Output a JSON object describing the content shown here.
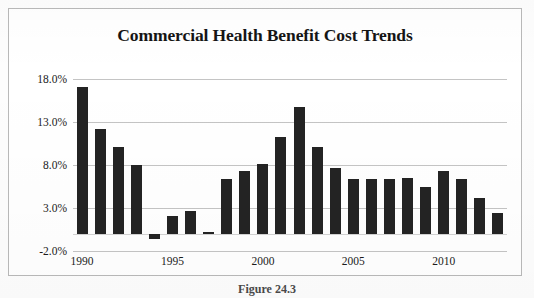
{
  "chart_data": {
    "type": "bar",
    "title": "Commercial Health Benefit Cost Trends",
    "xlabel": "",
    "ylabel": "",
    "grid": true,
    "legend": false,
    "ylim": [
      -2.0,
      18.0
    ],
    "ytick_labels": [
      "18.0%",
      "13.0%",
      "8.0%",
      "3.0%",
      "-2.0%"
    ],
    "ytick_values": [
      18.0,
      13.0,
      8.0,
      3.0,
      -2.0
    ],
    "xtick_labels": [
      "1990",
      "1995",
      "2000",
      "2005",
      "2010"
    ],
    "xtick_values": [
      1990,
      1995,
      2000,
      2005,
      2010
    ],
    "categories": [
      "1990",
      "1991",
      "1992",
      "1993",
      "1994",
      "1995",
      "1996",
      "1997",
      "1998",
      "1999",
      "2000",
      "2001",
      "2002",
      "2003",
      "2004",
      "2005",
      "2006",
      "2007",
      "2008",
      "2009",
      "2010",
      "2011",
      "2012",
      "2013"
    ],
    "values": [
      17.1,
      12.2,
      10.1,
      8.0,
      -0.6,
      2.1,
      2.6,
      0.2,
      6.4,
      7.3,
      8.1,
      11.3,
      14.7,
      10.1,
      7.7,
      6.4,
      6.4,
      6.4,
      6.5,
      5.5,
      7.3,
      6.4,
      4.2,
      2.4
    ],
    "bar_color": "#232323",
    "grid_color": "#c4c4c4",
    "baseline_value": 0.0
  },
  "caption": {
    "text": "Figure 24.3"
  }
}
